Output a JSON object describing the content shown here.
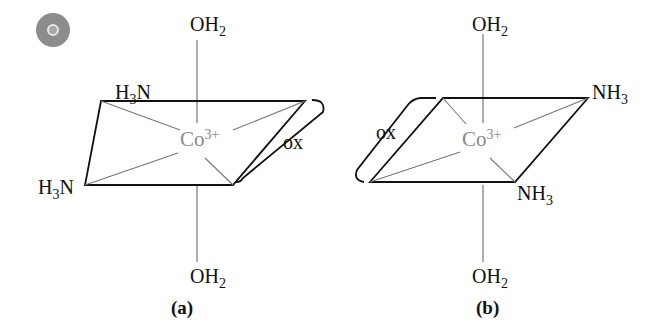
{
  "figure": {
    "badge_icon": "target-icon",
    "panel_a": {
      "caption": "(a)",
      "top_ligand": {
        "main": "OH",
        "sub": "2"
      },
      "bottom_ligand": {
        "main": "OH",
        "sub": "2"
      },
      "ligand_upper_left": {
        "pre": "H",
        "sub": "3",
        "post": "N"
      },
      "ligand_lower_left": {
        "pre": "H",
        "sub": "3",
        "post": "N"
      },
      "metal": {
        "main": "Co",
        "sup": "3+"
      },
      "bidentate_label": "ox"
    },
    "panel_b": {
      "caption": "(b)",
      "top_ligand": {
        "main": "OH",
        "sub": "2"
      },
      "bottom_ligand": {
        "main": "OH",
        "sub": "2"
      },
      "ligand_upper_right": {
        "main": "NH",
        "sub": "3"
      },
      "ligand_lower_right": {
        "main": "NH",
        "sub": "3"
      },
      "metal": {
        "main": "Co",
        "sup": "3+"
      },
      "bidentate_label": "ox"
    }
  }
}
